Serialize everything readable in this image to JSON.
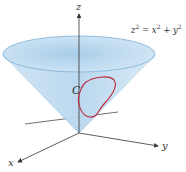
{
  "figure": {
    "surface_equation": {
      "lhs_var": "z",
      "exp": "2",
      "op_eq": " = ",
      "x_var": "x",
      "op_plus": " + ",
      "y_var": "y"
    },
    "curve_label": "C",
    "axes": {
      "x": "x",
      "y": "y",
      "z": "z"
    },
    "colors": {
      "cone_fill": "#bcd9ef",
      "cone_rim": "#7fb0d6",
      "curve": "#c0283a",
      "axis": "#333333"
    }
  }
}
